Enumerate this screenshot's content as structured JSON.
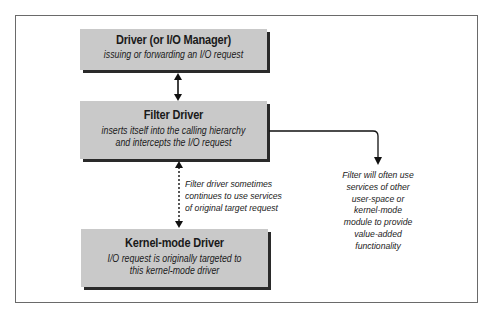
{
  "diagram": {
    "boxes": [
      {
        "id": "driver-io-manager",
        "title": "Driver (or I/O Manager)",
        "subtitle": "issuing or forwarding an I/O request"
      },
      {
        "id": "filter-driver",
        "title": "Filter Driver",
        "subtitle": "inserts itself into the calling hierarchy\nand intercepts the I/O request"
      },
      {
        "id": "kernel-mode-driver",
        "title": "Kernel-mode Driver",
        "subtitle": "I/O request is originally targeted to\nthis kernel-mode driver"
      }
    ],
    "notes": {
      "dotted_connector": "Filter driver sometimes\ncontinues to use services\nof original target request",
      "side_connector": "Filter will often use\nservices of other\nuser-space or\nkernel-mode\nmodule to provide\nvalue-added\nfunctionality"
    },
    "connectors": [
      {
        "from": "driver-io-manager",
        "to": "filter-driver",
        "style": "solid",
        "direction": "bidirectional"
      },
      {
        "from": "filter-driver",
        "to": "kernel-mode-driver",
        "style": "dotted",
        "direction": "bidirectional"
      },
      {
        "from": "filter-driver",
        "to": "side-note",
        "style": "solid",
        "direction": "forward"
      }
    ],
    "colors": {
      "box_fill": "#c9c9c9",
      "box_shadow": "#2a2a2a",
      "frame": "#6a6a6a",
      "line": "#111111"
    }
  }
}
